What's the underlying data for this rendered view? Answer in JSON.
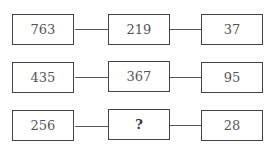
{
  "rows": [
    {
      "left": "763",
      "middle": "219",
      "right": "37"
    },
    {
      "left": "435",
      "middle": "367",
      "right": "95"
    },
    {
      "left": "256",
      "middle": "?",
      "right": "28"
    }
  ]
}
